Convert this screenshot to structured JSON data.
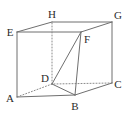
{
  "figure": {
    "kind": "geometry-diagram",
    "canvas": {
      "width": 126,
      "height": 117,
      "background": "#ffffff"
    },
    "style": {
      "solid_edge_color": "#6f6f6f",
      "hidden_edge_color": "#8a8a8a",
      "diagonal_color": "#5f5f5f",
      "label_color": "#2b2b2b",
      "solid_edge_width": 1,
      "hidden_edge_width": 1,
      "hidden_edge_dash": "1,2"
    },
    "vertices": [
      {
        "id": "A",
        "label": "A",
        "x": 17,
        "y": 97,
        "label_x": 10,
        "label_y": 98,
        "hidden": false
      },
      {
        "id": "B",
        "label": "B",
        "x": 75,
        "y": 95,
        "label_x": 75,
        "label_y": 106,
        "hidden": false
      },
      {
        "id": "C",
        "label": "C",
        "x": 112,
        "y": 83,
        "label_x": 118,
        "label_y": 84,
        "hidden": false
      },
      {
        "id": "D",
        "label": "D",
        "x": 52,
        "y": 84,
        "label_x": 45,
        "label_y": 78,
        "hidden": true
      },
      {
        "id": "E",
        "label": "E",
        "x": 17,
        "y": 32,
        "label_x": 10,
        "label_y": 32,
        "hidden": false
      },
      {
        "id": "F",
        "label": "F",
        "x": 81,
        "y": 32,
        "label_x": 87,
        "label_y": 39,
        "hidden": false
      },
      {
        "id": "G",
        "label": "G",
        "x": 112,
        "y": 22,
        "label_x": 118,
        "label_y": 15,
        "hidden": false
      },
      {
        "id": "H",
        "label": "H",
        "x": 52,
        "y": 22,
        "label_x": 52,
        "label_y": 14,
        "hidden": false
      }
    ],
    "edges": [
      {
        "from": "A",
        "to": "B",
        "type": "solid"
      },
      {
        "from": "B",
        "to": "C",
        "type": "solid"
      },
      {
        "from": "C",
        "to": "D",
        "type": "hidden"
      },
      {
        "from": "D",
        "to": "A",
        "type": "hidden"
      },
      {
        "from": "E",
        "to": "F",
        "type": "solid"
      },
      {
        "from": "F",
        "to": "G",
        "type": "solid"
      },
      {
        "from": "G",
        "to": "H",
        "type": "solid"
      },
      {
        "from": "H",
        "to": "E",
        "type": "solid"
      },
      {
        "from": "A",
        "to": "E",
        "type": "solid"
      },
      {
        "from": "B",
        "to": "F",
        "type": "solid"
      },
      {
        "from": "C",
        "to": "G",
        "type": "solid"
      },
      {
        "from": "D",
        "to": "H",
        "type": "hidden"
      },
      {
        "from": "D",
        "to": "B",
        "type": "solid"
      },
      {
        "from": "D",
        "to": "F",
        "type": "solid"
      }
    ],
    "annotations": {
      "diagonal_label": "DF",
      "hidden_vertex": "D"
    }
  }
}
